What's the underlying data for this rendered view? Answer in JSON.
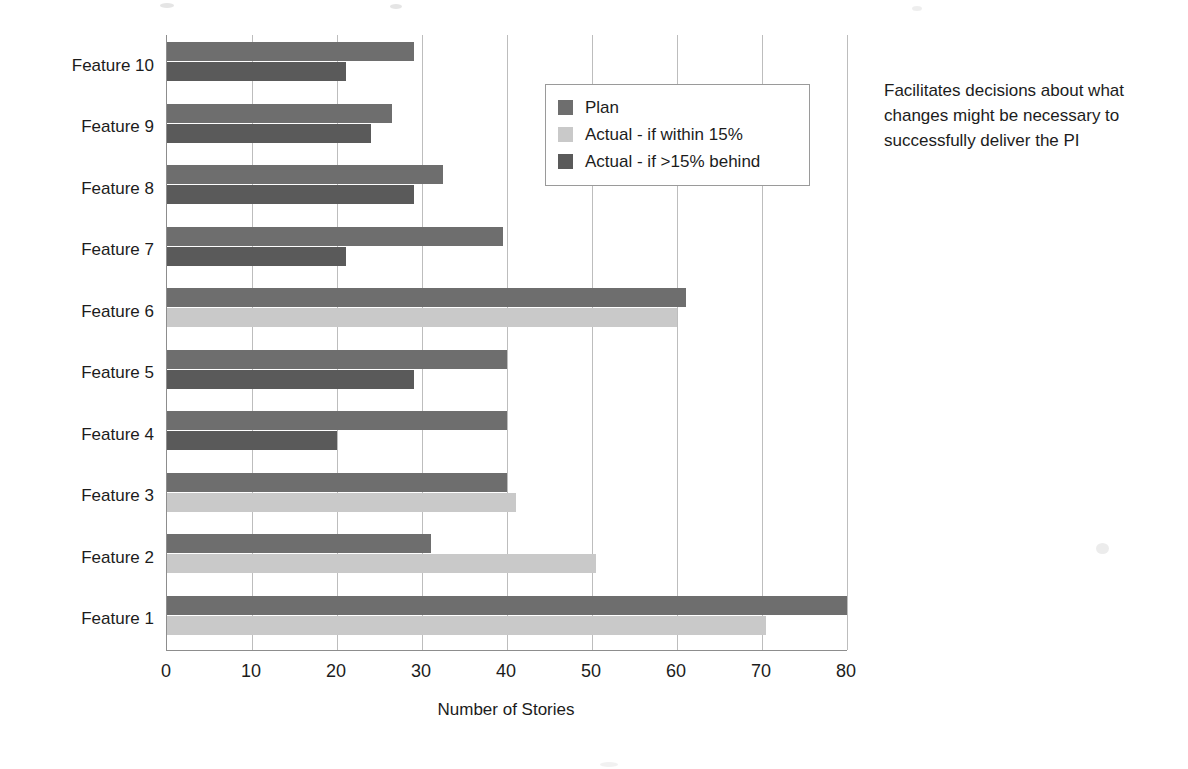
{
  "chart_data": {
    "type": "bar",
    "orientation": "horizontal",
    "title": "",
    "xlabel": "Number of Stories",
    "ylabel": "",
    "xlim": [
      0,
      80
    ],
    "xticks": [
      0,
      10,
      20,
      30,
      40,
      50,
      60,
      70,
      80
    ],
    "grid": true,
    "legend_position": "inside-upper-right",
    "categories": [
      "Feature 1",
      "Feature 2",
      "Feature 3",
      "Feature 4",
      "Feature 5",
      "Feature 6",
      "Feature 7",
      "Feature 8",
      "Feature 9",
      "Feature 10"
    ],
    "series": [
      {
        "name": "Plan",
        "color": "#6e6e6e",
        "values": [
          80,
          31,
          40,
          40,
          40,
          61,
          39.5,
          32.5,
          26.5,
          29
        ]
      },
      {
        "name": "Actual",
        "values": [
          70.5,
          50.5,
          41,
          20,
          29,
          60,
          21,
          29,
          24,
          21
        ],
        "status": [
          "within",
          "within",
          "within",
          "behind",
          "behind",
          "within",
          "behind",
          "behind",
          "behind",
          "behind"
        ]
      }
    ],
    "legend": [
      {
        "label": "Plan",
        "color": "#6e6e6e",
        "swatch": "plan-swatch"
      },
      {
        "label": "Actual - if within 15%",
        "color": "#c9c9c9",
        "swatch": "actual-within-swatch"
      },
      {
        "label": "Actual - if >15% behind",
        "color": "#5a5a5a",
        "swatch": "actual-behind-swatch"
      }
    ]
  },
  "annotation": {
    "text": "Facilitates decisions about what changes might be necessary to successfully deliver the PI"
  },
  "colors": {
    "plan": "#6e6e6e",
    "actual_within": "#c9c9c9",
    "actual_behind": "#5a5a5a",
    "gridline": "#bdbdbd",
    "axis": "#8d8d8d",
    "text": "#1c1c1c",
    "background": "#ffffff"
  }
}
